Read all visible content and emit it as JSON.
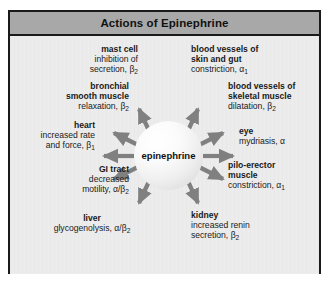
{
  "figure": {
    "title": "Actions of Epinephrine",
    "center_label": "epinephrine",
    "colors": {
      "title_bar": "#a8a8a8",
      "canvas": "#ececec",
      "border": "#1a1a1a",
      "arrow": "#808080",
      "sphere": "#f2f2f2"
    }
  },
  "targets": [
    {
      "id": "mast-cell",
      "organ": "mast cell",
      "effect_line1": "inhibition of",
      "effect_line2": "secretion, β",
      "receptor_sub": "2",
      "side": "left"
    },
    {
      "id": "bronchial-smooth-muscle",
      "organ_line1": "bronchial",
      "organ_line2": "smooth muscle",
      "effect_line1": "relaxation, β",
      "receptor_sub": "2",
      "side": "left"
    },
    {
      "id": "heart",
      "organ": "heart",
      "effect_line1": "increased rate",
      "effect_line2": "and force, β",
      "receptor_sub": "1",
      "side": "left"
    },
    {
      "id": "gi-tract",
      "organ": "GI tract",
      "effect_line1": "decreased",
      "effect_line2": "motility, α/β",
      "receptor_sub": "2",
      "side": "left"
    },
    {
      "id": "liver",
      "organ": "liver",
      "effect_line1": "glycogenolysis, α/β",
      "receptor_sub": "2",
      "side": "bottom-left"
    },
    {
      "id": "blood-vessels-skin-gut",
      "organ_line1": "blood vessels of",
      "organ_line2": "skin and gut",
      "effect_line1": "constriction, α",
      "receptor_sub": "1",
      "side": "right"
    },
    {
      "id": "blood-vessels-skeletal-muscle",
      "organ_line1": "blood vessels of",
      "organ_line2": "skeletal muscle",
      "effect_line1": "dilatation, β",
      "receptor_sub": "2",
      "side": "right"
    },
    {
      "id": "eye",
      "organ": "eye",
      "effect_line1": "mydriasis, α",
      "receptor_sub": "",
      "side": "right"
    },
    {
      "id": "pilo-erector-muscle",
      "organ_line1": "pilo-erector",
      "organ_line2": "muscle",
      "effect_line1": "constriction, α",
      "receptor_sub": "1",
      "side": "right"
    },
    {
      "id": "kidney",
      "organ": "kidney",
      "effect_line1": "increased renin",
      "effect_line2": "secretion, β",
      "receptor_sub": "2",
      "side": "bottom-right"
    }
  ]
}
